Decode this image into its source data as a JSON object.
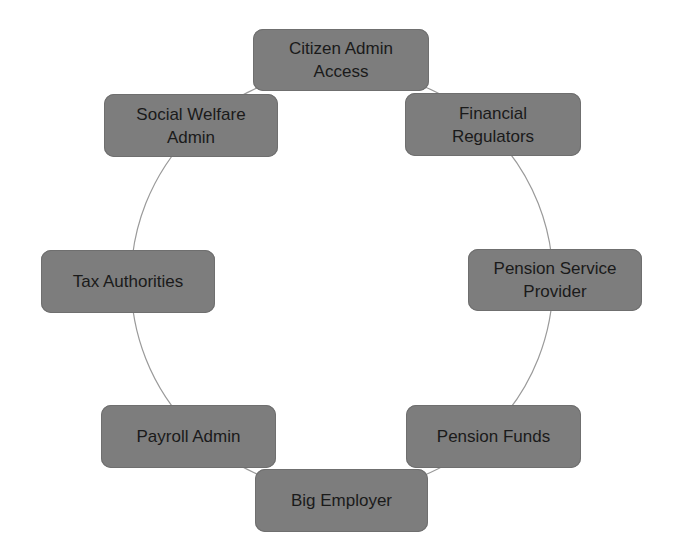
{
  "diagram": {
    "type": "cycle",
    "ring": {
      "center_x": 342,
      "center_y": 281,
      "radius": 211,
      "stroke_color": "#9a9a9a"
    },
    "node_fill_color": "#7d7d7d",
    "node_text_color": "#1a1a1a",
    "nodes": [
      {
        "id": "citizen-admin-access",
        "label": "Citizen Admin\nAccess",
        "x": 253,
        "y": 29,
        "w": 176,
        "h": 62
      },
      {
        "id": "financial-regulators",
        "label": "Financial\nRegulators",
        "x": 405,
        "y": 93,
        "w": 176,
        "h": 63
      },
      {
        "id": "pension-service-provider",
        "label": "Pension Service\nProvider",
        "x": 468,
        "y": 249,
        "w": 174,
        "h": 62
      },
      {
        "id": "pension-funds",
        "label": "Pension Funds",
        "x": 406,
        "y": 405,
        "w": 175,
        "h": 63
      },
      {
        "id": "big-employer",
        "label": "Big Employer",
        "x": 255,
        "y": 469,
        "w": 173,
        "h": 63
      },
      {
        "id": "payroll-admin",
        "label": "Payroll Admin",
        "x": 101,
        "y": 405,
        "w": 175,
        "h": 63
      },
      {
        "id": "tax-authorities",
        "label": "Tax Authorities",
        "x": 41,
        "y": 250,
        "w": 174,
        "h": 63
      },
      {
        "id": "social-welfare-admin",
        "label": "Social Welfare\nAdmin",
        "x": 104,
        "y": 94,
        "w": 174,
        "h": 63
      }
    ]
  }
}
